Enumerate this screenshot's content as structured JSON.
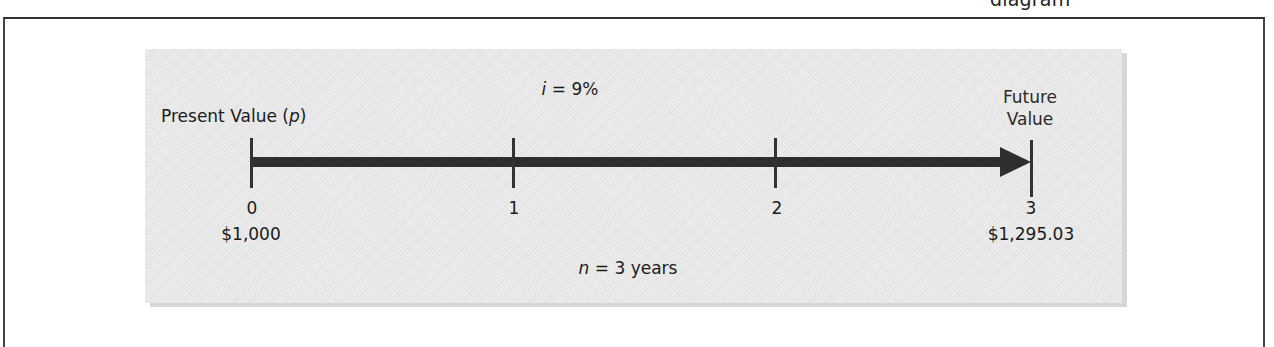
{
  "figure": {
    "clipped_caption": "diagram"
  },
  "timeline": {
    "rate_label_var": "i",
    "rate_label_rest": " = 9%",
    "present_value_label_prefix": "Present Value (",
    "present_value_label_var": "p",
    "present_value_label_suffix": ")",
    "future_value_label_line1": "Future",
    "future_value_label_line2": "Value",
    "periods": [
      {
        "label": "0",
        "amount": "$1,000"
      },
      {
        "label": "1",
        "amount": ""
      },
      {
        "label": "2",
        "amount": ""
      },
      {
        "label": "3",
        "amount": "$1,295.03"
      }
    ],
    "duration_var": "n",
    "duration_rest": " = 3 years"
  },
  "colors": {
    "panel_bg": "#e9e9e9",
    "arrow": "#2e2e2e",
    "text": "#1b1b1b"
  }
}
